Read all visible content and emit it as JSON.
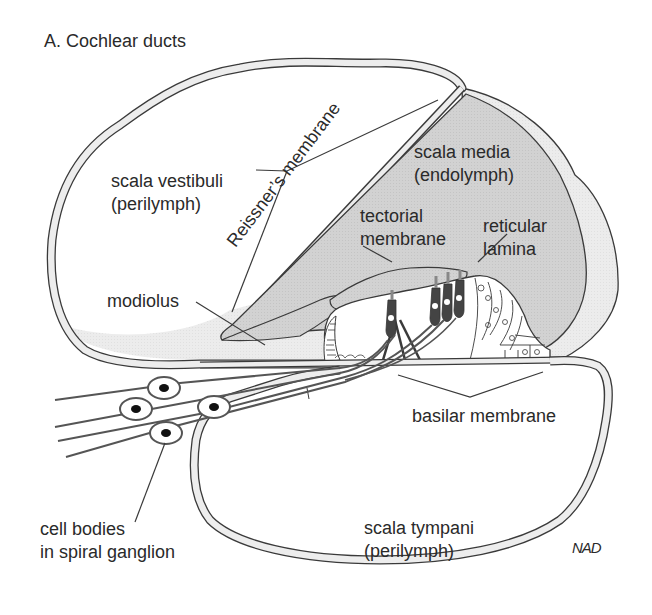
{
  "figure": {
    "title": "A. Cochlear ducts",
    "signature": "NAD",
    "colors": {
      "outline": "#3a3a3a",
      "wall_fill": "#ebebeb",
      "scala_media_fill": "#d4d4d4",
      "modiolus_fill": "#ececec",
      "background": "#ffffff",
      "text": "#2a2a2a"
    }
  },
  "labels": {
    "scala_vestibuli": {
      "line1": "scala vestibuli",
      "line2": "(perilymph)"
    },
    "reissners_membrane": "Reissner’s membrane",
    "scala_media": {
      "line1": "scala media",
      "line2": "(endolymph)"
    },
    "tectorial_membrane": {
      "line1": "tectorial",
      "line2": "membrane"
    },
    "reticular_lamina": {
      "line1": "reticular",
      "line2": "lamina"
    },
    "modiolus": "modiolus",
    "basilar_membrane": "basilar membrane",
    "cell_bodies": {
      "line1": "cell bodies",
      "line2": "in spiral ganglion"
    },
    "scala_tympani": {
      "line1": "scala tympani",
      "line2": "(perilymph)"
    }
  }
}
